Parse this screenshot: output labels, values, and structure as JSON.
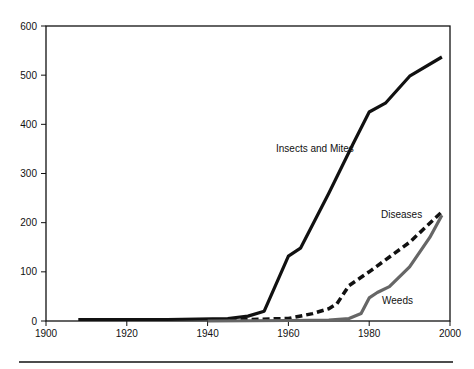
{
  "chart_data": {
    "type": "line",
    "title": "",
    "xlabel": "",
    "ylabel": "",
    "xlim": [
      1900,
      2000
    ],
    "ylim": [
      0,
      600
    ],
    "grid": false,
    "xticks": [
      "1900",
      "1920",
      "1940",
      "1960",
      "1980",
      "2000"
    ],
    "yticks": [
      "0",
      "100",
      "200",
      "300",
      "400",
      "500",
      "600"
    ],
    "series": [
      {
        "name": "Insects and Mites",
        "style": "solid",
        "color": "#111111",
        "x": [
          1908,
          1930,
          1945,
          1950,
          1954,
          1960,
          1963,
          1970,
          1976,
          1980,
          1984,
          1990,
          1998
        ],
        "y": [
          3,
          3,
          5,
          10,
          20,
          132,
          148,
          260,
          360,
          425,
          443,
          498,
          537
        ]
      },
      {
        "name": "Diseases",
        "style": "dashed",
        "color": "#111111",
        "x": [
          1940,
          1950,
          1960,
          1966,
          1970,
          1972,
          1975,
          1980,
          1990,
          1998
        ],
        "y": [
          2,
          3,
          5,
          15,
          25,
          35,
          72,
          100,
          160,
          222
        ]
      },
      {
        "name": "Weeds",
        "style": "solid",
        "color": "#666666",
        "x": [
          1940,
          1960,
          1970,
          1975,
          1978,
          1980,
          1982,
          1985,
          1990,
          1995,
          1998
        ],
        "y": [
          0,
          1,
          2,
          5,
          15,
          47,
          58,
          70,
          110,
          170,
          215
        ]
      }
    ],
    "annotations": [
      {
        "text": "Insects and Mites",
        "series": "Insects and Mites"
      },
      {
        "text": "Diseases",
        "series": "Diseases"
      },
      {
        "text": "Weeds",
        "series": "Weeds"
      }
    ]
  }
}
